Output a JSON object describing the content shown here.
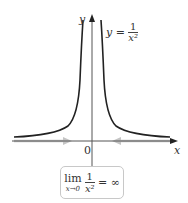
{
  "diagram": {
    "curve_label_prefix": "y =",
    "curve_label_num": "1",
    "curve_label_den": "x²",
    "y_axis_label": "y",
    "x_axis_label": "x",
    "origin_label": "0",
    "limit": {
      "lim": "lim",
      "sub": "x→0",
      "num": "1",
      "den": "x²",
      "result": "= ∞"
    },
    "colors": {
      "curve": "#222222",
      "axis": "#555555",
      "approach_arrows": "#bfbfbf",
      "box_border": "#c8c8c8"
    }
  }
}
